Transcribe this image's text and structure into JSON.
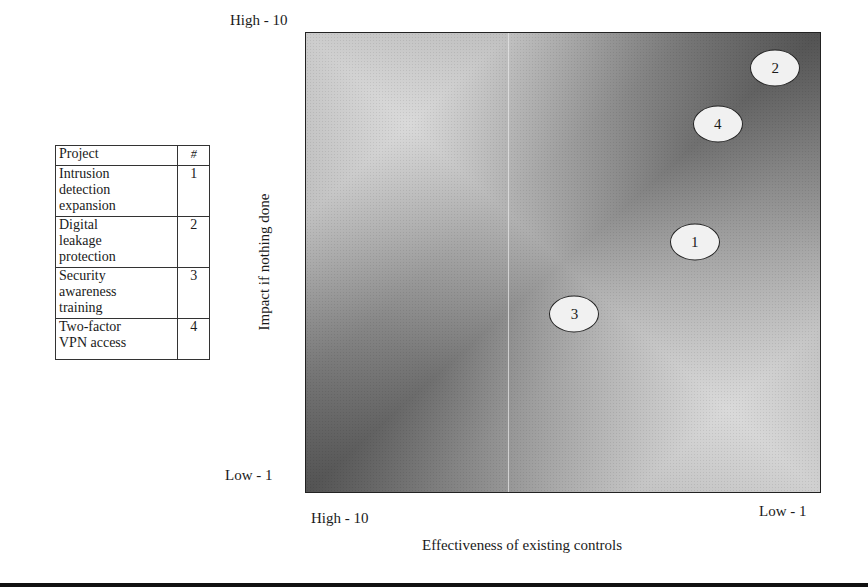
{
  "legend": {
    "headers": {
      "project": "Project",
      "number": "#"
    },
    "rows": [
      {
        "name": "Intrusion detection expansion",
        "lines": [
          "Intrusion",
          "detection",
          "expansion"
        ],
        "number": "1"
      },
      {
        "name": "Digital leakage protection",
        "lines": [
          "Digital",
          "leakage",
          "protection"
        ],
        "number": "2"
      },
      {
        "name": "Security awareness training",
        "lines": [
          "Security",
          "awareness",
          "training"
        ],
        "number": "3"
      },
      {
        "name": "Two-factor VPN access",
        "lines": [
          "Two-factor",
          "VPN access"
        ],
        "number": "4"
      }
    ]
  },
  "axes": {
    "y_title": "Impact if nothing done",
    "y_top_label": "High - 10",
    "y_bottom_label": "Low - 1",
    "x_title": "Effectiveness of existing controls",
    "x_left_label": "High - 10",
    "x_right_label": "Low - 1"
  },
  "chart_data": {
    "type": "scatter",
    "title": "",
    "xlabel": "Effectiveness of existing controls",
    "ylabel": "Impact if nothing done",
    "xlim": [
      10,
      1
    ],
    "ylim": [
      1,
      10
    ],
    "x_reversed": true,
    "tick_labels": {
      "x": [
        "High - 10",
        "Low - 1"
      ],
      "y": [
        "Low - 1",
        "High - 10"
      ]
    },
    "grid": false,
    "legend_position": "left (table)",
    "background": "gray diagonal gradient with light band from top-left to bottom-right",
    "points": [
      {
        "label": "1",
        "project": "Intrusion detection expansion",
        "x": 3.2,
        "y": 5.9
      },
      {
        "label": "2",
        "project": "Digital leakage protection",
        "x": 1.8,
        "y": 9.3
      },
      {
        "label": "3",
        "project": "Security awareness training",
        "x": 5.3,
        "y": 4.5
      },
      {
        "label": "4",
        "project": "Two-factor VPN access",
        "x": 2.8,
        "y": 8.2
      }
    ]
  }
}
